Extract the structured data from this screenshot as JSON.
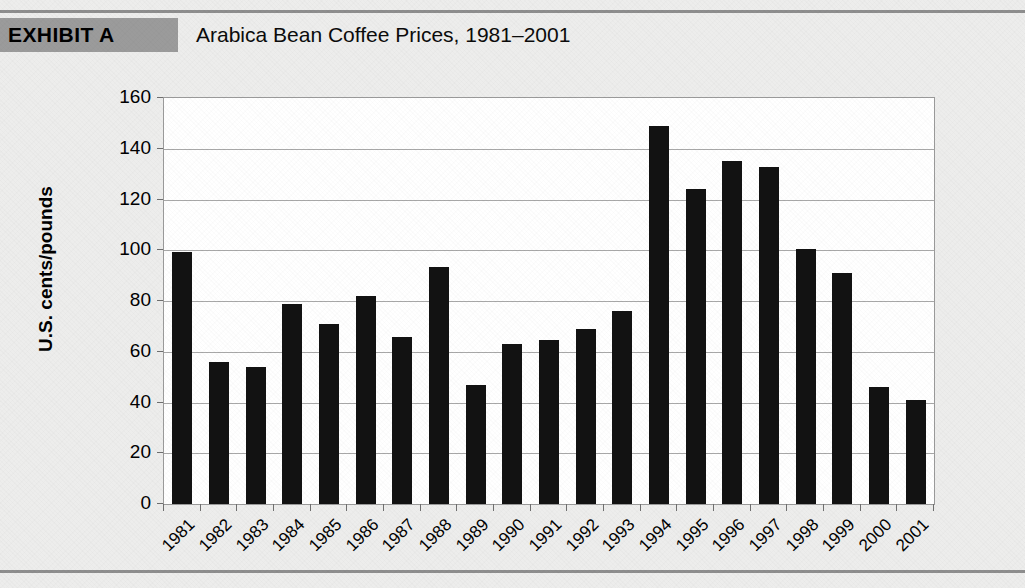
{
  "exhibit": {
    "tag": "EXHIBIT A",
    "title": "Arabica Bean Coffee Prices, 1981–2001"
  },
  "colors": {
    "page_background": "#ededec",
    "tag_background": "#9b9b9b",
    "plot_background": "#ffffff",
    "bar": "#121212",
    "gridline": "#a8a8a8",
    "rule": "#8e8e8e"
  },
  "chart_data": {
    "type": "bar",
    "title": "Arabica Bean Coffee Prices, 1981–2001",
    "xlabel": "",
    "ylabel": "U.S. cents/pounds",
    "categories": [
      "1981",
      "1982",
      "1983",
      "1984",
      "1985",
      "1986",
      "1987",
      "1988",
      "1989",
      "1990",
      "1991",
      "1992",
      "1993",
      "1994",
      "1995",
      "1996",
      "1997",
      "1998",
      "1999",
      "2000",
      "2001"
    ],
    "values": [
      99.5,
      56,
      54,
      79,
      71,
      82,
      66,
      93.5,
      47,
      63,
      64.5,
      69,
      76,
      149,
      124,
      135,
      133,
      100.5,
      91,
      46,
      41
    ],
    "ylim": [
      0,
      160
    ],
    "yticks": [
      0,
      20,
      40,
      60,
      80,
      100,
      120,
      140,
      160
    ],
    "ytick_labels": [
      "0",
      "20",
      "40",
      "60",
      "80",
      "100",
      "120",
      "140",
      "160"
    ],
    "grid": true,
    "legend": "none"
  }
}
